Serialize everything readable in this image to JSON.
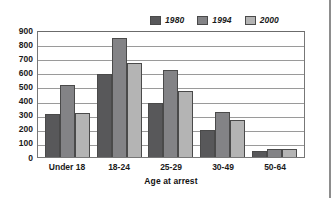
{
  "chart_data": {
    "type": "bar",
    "title": "",
    "xlabel": "Age at arrest",
    "ylabel": "",
    "categories": [
      "Under 18",
      "18-24",
      "25-29",
      "30-49",
      "50-64"
    ],
    "series": [
      {
        "name": "1980",
        "color": "#58585a",
        "values": [
          305,
          590,
          385,
          190,
          40
        ]
      },
      {
        "name": "1994",
        "color": "#838386",
        "values": [
          510,
          840,
          615,
          320,
          58
        ]
      },
      {
        "name": "2000",
        "color": "#b4b4b4",
        "values": [
          315,
          665,
          465,
          260,
          60
        ]
      }
    ],
    "ylim": [
      0,
      900
    ],
    "yticks": [
      900,
      800,
      700,
      600,
      500,
      400,
      300,
      200,
      100,
      0
    ],
    "grid": true,
    "legend_position": "top-right"
  }
}
